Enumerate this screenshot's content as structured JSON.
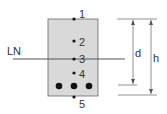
{
  "diagram": {
    "type": "beam-cross-section",
    "neutral_axis_label": "LN",
    "points": [
      {
        "label": "1",
        "x": 74,
        "y": 19
      },
      {
        "label": "2",
        "x": 74,
        "y": 41
      },
      {
        "label": "3",
        "x": 74,
        "y": 59
      },
      {
        "label": "4",
        "x": 74,
        "y": 73
      },
      {
        "label": "5",
        "x": 74,
        "y": 97
      }
    ],
    "rebars": [
      {
        "x": 59,
        "y": 86
      },
      {
        "x": 74,
        "y": 86
      },
      {
        "x": 89,
        "y": 86
      }
    ],
    "dimensions": {
      "d_label": "d",
      "h_label": "h"
    },
    "colors": {
      "section_fill": "#d9d9d9",
      "stroke": "#555555",
      "text": "#333333"
    }
  }
}
